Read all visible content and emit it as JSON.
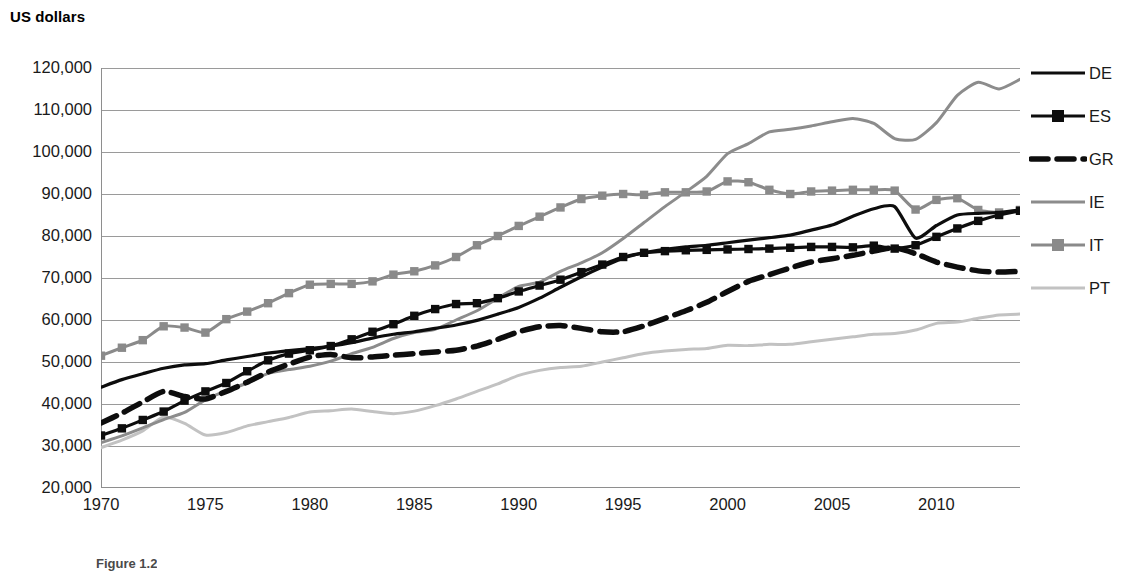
{
  "axis_title": "US dollars",
  "caption": "Figure 1.2",
  "colors": {
    "DE": "#0d0d0d",
    "ES": "#0d0d0d",
    "GR": "#0d0d0d",
    "IE": "#8c8c8c",
    "IT": "#8a8a8a",
    "PT": "#c2c2c2",
    "gridline": "#9a9a9a",
    "axis": "#8e8e8e",
    "text": "#1a1a1a"
  },
  "legend": {
    "position": "right",
    "entries": [
      {
        "label": "DE",
        "style": "solid",
        "color": "#0d0d0d",
        "marker": "none",
        "width": 3.2
      },
      {
        "label": "ES",
        "style": "solid",
        "color": "#0d0d0d",
        "marker": "square",
        "width": 3.2
      },
      {
        "label": "GR",
        "style": "dashed",
        "color": "#0d0d0d",
        "marker": "none",
        "width": 5.5
      },
      {
        "label": "IE",
        "style": "solid",
        "color": "#8c8c8c",
        "marker": "none",
        "width": 3.0
      },
      {
        "label": "IT",
        "style": "solid",
        "color": "#8a8a8a",
        "marker": "square",
        "width": 3.0
      },
      {
        "label": "PT",
        "style": "solid",
        "color": "#c2c2c2",
        "marker": "none",
        "width": 3.0
      }
    ]
  },
  "chart_data": {
    "type": "line",
    "title": "",
    "subtitle": "",
    "xlabel": "",
    "ylabel": "US dollars",
    "xlim": [
      1970,
      2014
    ],
    "ylim": [
      20000,
      120000
    ],
    "grid": true,
    "ytick_labels": [
      "120,000",
      "110,000",
      "100,000",
      "90,000",
      "80,000",
      "70,000",
      "60,000",
      "50,000",
      "40,000",
      "30,000",
      "20,000"
    ],
    "yticks": [
      120000,
      110000,
      100000,
      90000,
      80000,
      70000,
      60000,
      50000,
      40000,
      30000,
      20000
    ],
    "xtick_labels": [
      "1970",
      "1975",
      "1980",
      "1985",
      "1990",
      "1995",
      "2000",
      "2005",
      "2010"
    ],
    "xticks": [
      1970,
      1975,
      1980,
      1985,
      1990,
      1995,
      2000,
      2005,
      2010
    ],
    "x": [
      1970,
      1971,
      1972,
      1973,
      1974,
      1975,
      1976,
      1977,
      1978,
      1979,
      1980,
      1981,
      1982,
      1983,
      1984,
      1985,
      1986,
      1987,
      1988,
      1989,
      1990,
      1991,
      1992,
      1993,
      1994,
      1995,
      1996,
      1997,
      1998,
      1999,
      2000,
      2001,
      2002,
      2003,
      2004,
      2005,
      2006,
      2007,
      2008,
      2009,
      2010,
      2011,
      2012,
      2013,
      2014
    ],
    "series": [
      {
        "name": "DE",
        "values": [
          44000,
          45800,
          47200,
          48500,
          49300,
          49600,
          50500,
          51300,
          52100,
          52700,
          53200,
          53800,
          54600,
          55700,
          56600,
          57200,
          58000,
          58800,
          59900,
          61400,
          63000,
          65200,
          67800,
          70300,
          72600,
          74700,
          76000,
          76800,
          77400,
          77800,
          78400,
          79000,
          79600,
          80200,
          81400,
          82600,
          84700,
          86500,
          87000,
          79500,
          82500,
          85000,
          85400,
          85600,
          86200
        ]
      },
      {
        "name": "ES",
        "values": [
          32500,
          34200,
          36200,
          38200,
          40800,
          43000,
          45000,
          47800,
          50400,
          52000,
          52800,
          53800,
          55400,
          57200,
          59000,
          61000,
          62600,
          63800,
          64000,
          65200,
          66800,
          68200,
          69600,
          71400,
          73200,
          75000,
          76000,
          76400,
          76600,
          76700,
          76800,
          76900,
          77000,
          77200,
          77400,
          77400,
          77300,
          77700,
          77000,
          77800,
          79800,
          81800,
          83600,
          85000,
          86000
        ]
      },
      {
        "name": "GR",
        "values": [
          35500,
          37800,
          40500,
          43000,
          41800,
          41200,
          43000,
          45200,
          47600,
          49500,
          51200,
          51800,
          51000,
          51200,
          51600,
          52000,
          52400,
          52800,
          53800,
          55400,
          57200,
          58400,
          58700,
          58000,
          57200,
          57200,
          58600,
          60400,
          62200,
          64200,
          66800,
          69200,
          70800,
          72400,
          73800,
          74600,
          75400,
          76400,
          77200,
          75800,
          73800,
          72600,
          71700,
          71400,
          71600
        ]
      },
      {
        "name": "IE",
        "values": [
          30800,
          32400,
          34300,
          36300,
          38000,
          41000,
          43200,
          45000,
          47300,
          48200,
          49000,
          50200,
          52000,
          53500,
          55600,
          57000,
          57800,
          60000,
          62200,
          65200,
          68000,
          69000,
          71600,
          73600,
          76000,
          79400,
          83200,
          87000,
          90500,
          94200,
          99600,
          102000,
          104800,
          105400,
          106200,
          107200,
          108000,
          106800,
          103200,
          103000,
          107000,
          113500,
          116600,
          115000,
          117300
        ]
      },
      {
        "name": "IT",
        "values": [
          51500,
          53400,
          55200,
          58500,
          58200,
          57000,
          60200,
          62000,
          64000,
          66400,
          68400,
          68600,
          68600,
          69200,
          70800,
          71600,
          73000,
          75000,
          77800,
          80000,
          82400,
          84600,
          86800,
          88800,
          89600,
          90000,
          89800,
          90400,
          90400,
          90600,
          93000,
          92800,
          91000,
          90000,
          90600,
          90800,
          91000,
          91000,
          90800,
          86300,
          88600,
          89000,
          86200,
          85600,
          86200
        ]
      },
      {
        "name": "PT",
        "values": [
          29600,
          31400,
          33600,
          36900,
          35400,
          32600,
          33200,
          34800,
          35800,
          36800,
          38100,
          38400,
          38800,
          38200,
          37700,
          38300,
          39600,
          41200,
          43000,
          44800,
          46800,
          48000,
          48700,
          49000,
          50000,
          51000,
          52000,
          52600,
          53000,
          53200,
          54000,
          53900,
          54200,
          54200,
          54800,
          55400,
          56000,
          56600,
          56800,
          57600,
          59200,
          59500,
          60400,
          61200,
          61400
        ]
      }
    ]
  }
}
